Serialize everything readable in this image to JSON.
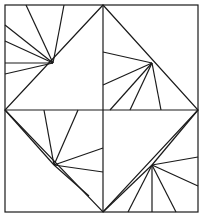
{
  "figure": {
    "canvas": {
      "width": 203,
      "height": 216
    },
    "colors": {
      "background": "#ffffff",
      "stroke": "#1a1a1a"
    },
    "stroke_width": 1.2,
    "frame": {
      "name": "outer-square",
      "x": 5,
      "y": 5,
      "width": 193,
      "height": 207
    },
    "midlines": [
      {
        "name": "horizontal-midline",
        "x1": 5,
        "y1": 110,
        "x2": 198,
        "y2": 110
      },
      {
        "name": "vertical-midline",
        "x1": 103,
        "y1": 5,
        "x2": 103,
        "y2": 212
      }
    ],
    "diamond": {
      "name": "inscribed-diamond",
      "points": "103,5 198,110 103,212 5,110"
    },
    "hubs": [
      {
        "name": "hub-top-left",
        "x": 53,
        "y": 63
      },
      {
        "name": "hub-top-right",
        "x": 152,
        "y": 63
      },
      {
        "name": "hub-bottom-left",
        "x": 54,
        "y": 165
      },
      {
        "name": "hub-bottom-right",
        "x": 152,
        "y": 165
      }
    ],
    "rays": [
      {
        "hub": "hub-top-left",
        "x1": 53,
        "y1": 63,
        "x2": 5,
        "y2": 25
      },
      {
        "hub": "hub-top-left",
        "x1": 53,
        "y1": 63,
        "x2": 5,
        "y2": 41
      },
      {
        "hub": "hub-top-left",
        "x1": 53,
        "y1": 63,
        "x2": 5,
        "y2": 63
      },
      {
        "hub": "hub-top-left",
        "x1": 53,
        "y1": 63,
        "x2": 5,
        "y2": 74
      },
      {
        "hub": "hub-top-left",
        "x1": 53,
        "y1": 63,
        "x2": 26,
        "y2": 5
      },
      {
        "hub": "hub-top-left",
        "x1": 53,
        "y1": 63,
        "x2": 64,
        "y2": 5
      },
      {
        "hub": "hub-top-right",
        "x1": 152,
        "y1": 63,
        "x2": 103,
        "y2": 52
      },
      {
        "hub": "hub-top-right",
        "x1": 152,
        "y1": 63,
        "x2": 103,
        "y2": 85
      },
      {
        "hub": "hub-top-right",
        "x1": 152,
        "y1": 63,
        "x2": 110,
        "y2": 110
      },
      {
        "hub": "hub-top-right",
        "x1": 152,
        "y1": 63,
        "x2": 130,
        "y2": 110
      },
      {
        "hub": "hub-top-right",
        "x1": 152,
        "y1": 63,
        "x2": 161,
        "y2": 110
      },
      {
        "hub": "hub-bottom-left",
        "x1": 54,
        "y1": 165,
        "x2": 5,
        "y2": 110
      },
      {
        "hub": "hub-bottom-left",
        "x1": 54,
        "y1": 165,
        "x2": 44,
        "y2": 110
      },
      {
        "hub": "hub-bottom-left",
        "x1": 54,
        "y1": 165,
        "x2": 78,
        "y2": 110
      },
      {
        "hub": "hub-bottom-left",
        "x1": 54,
        "y1": 165,
        "x2": 103,
        "y2": 148
      },
      {
        "hub": "hub-bottom-left",
        "x1": 54,
        "y1": 165,
        "x2": 103,
        "y2": 172
      },
      {
        "hub": "hub-bottom-left",
        "x1": 54,
        "y1": 165,
        "x2": 89,
        "y2": 196
      },
      {
        "hub": "hub-bottom-right",
        "x1": 152,
        "y1": 165,
        "x2": 198,
        "y2": 157
      },
      {
        "hub": "hub-bottom-right",
        "x1": 152,
        "y1": 165,
        "x2": 198,
        "y2": 186
      },
      {
        "hub": "hub-bottom-right",
        "x1": 152,
        "y1": 165,
        "x2": 198,
        "y2": 110
      },
      {
        "hub": "hub-bottom-right",
        "x1": 152,
        "y1": 165,
        "x2": 152,
        "y2": 212
      },
      {
        "hub": "hub-bottom-right",
        "x1": 152,
        "y1": 165,
        "x2": 176,
        "y2": 212
      },
      {
        "hub": "hub-bottom-right",
        "x1": 152,
        "y1": 165,
        "x2": 128,
        "y2": 212
      },
      {
        "hub": "hub-bottom-right",
        "x1": 152,
        "y1": 165,
        "x2": 103,
        "y2": 212
      }
    ]
  }
}
